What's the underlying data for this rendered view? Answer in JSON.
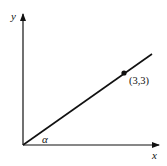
{
  "diagram": {
    "axes": {
      "x_label": "x",
      "y_label": "y"
    },
    "line": {
      "description": "straight line through origin",
      "angle_label": "α"
    },
    "point": {
      "label": "(3,3)",
      "x": 3,
      "y": 3
    },
    "colors": {
      "stroke": "#111111",
      "background": "#ffffff"
    }
  }
}
